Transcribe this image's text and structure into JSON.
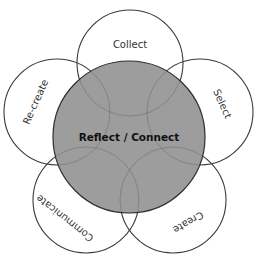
{
  "diagram": {
    "title_cropped": "",
    "center": {
      "label": "Reflect / Connect",
      "fill": "#9d9d9d",
      "cx": 129,
      "cy": 137,
      "r": 76
    },
    "petals": [
      {
        "id": "collect",
        "label": "Collect",
        "cx": 130,
        "cy": 63,
        "r": 53,
        "rotate": 0,
        "lx": 130,
        "ly": 45
      },
      {
        "id": "select",
        "label": "Select",
        "cx": 200,
        "cy": 112,
        "r": 53,
        "rotate": 66,
        "lx": 222,
        "ly": 104
      },
      {
        "id": "create",
        "label": "Create",
        "cx": 173,
        "cy": 200,
        "r": 53,
        "rotate": 150,
        "lx": 188,
        "ly": 222
      },
      {
        "id": "communicate",
        "label": "Communicate",
        "cx": 86,
        "cy": 200,
        "r": 53,
        "rotate": -142,
        "lx": 65,
        "ly": 218
      },
      {
        "id": "recreate",
        "label": "Re-create",
        "cx": 57,
        "cy": 112,
        "r": 53,
        "rotate": -66,
        "lx": 36,
        "ly": 102
      }
    ],
    "stroke_color": "#3a3a3a",
    "background": "#ffffff"
  }
}
